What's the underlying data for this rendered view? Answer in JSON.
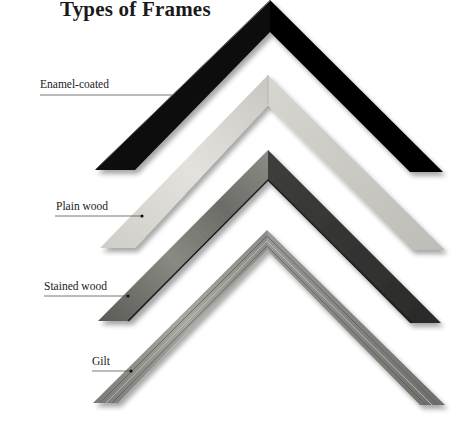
{
  "title": "Types of Frames",
  "frames": [
    {
      "label": "Enamel-coated",
      "color": "#0a0a0a"
    },
    {
      "label": "Plain wood",
      "color": "#d6d4ce"
    },
    {
      "label": "Stained wood",
      "color": "#4a4a48"
    },
    {
      "label": "Gilt",
      "color": "#8e8e8a"
    }
  ]
}
